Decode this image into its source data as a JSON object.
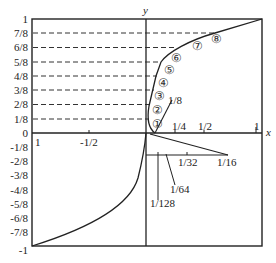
{
  "figure": {
    "axes": {
      "x_label": "x",
      "y_label": "y"
    },
    "y_ticks_positive": [
      "1",
      "7/8",
      "6/8",
      "5/8",
      "4/8",
      "3/8",
      "2/8",
      "1/8",
      "0"
    ],
    "y_ticks_negative": [
      "-1/8",
      "-2/8",
      "-3/8",
      "-4/8",
      "-5/8",
      "-6/8",
      "-7/8",
      "-1"
    ],
    "x_ticks_positive": [
      "1/4",
      "1/2",
      "1"
    ],
    "x_ticks_negative": [
      "1",
      "-1/2"
    ],
    "segment_labels": [
      "1/8",
      "1/16",
      "1/32",
      "1/64",
      "1/128"
    ],
    "circled_markers": [
      "①",
      "②",
      "③",
      "④",
      "⑤",
      "⑥",
      "⑦",
      "⑧"
    ]
  }
}
